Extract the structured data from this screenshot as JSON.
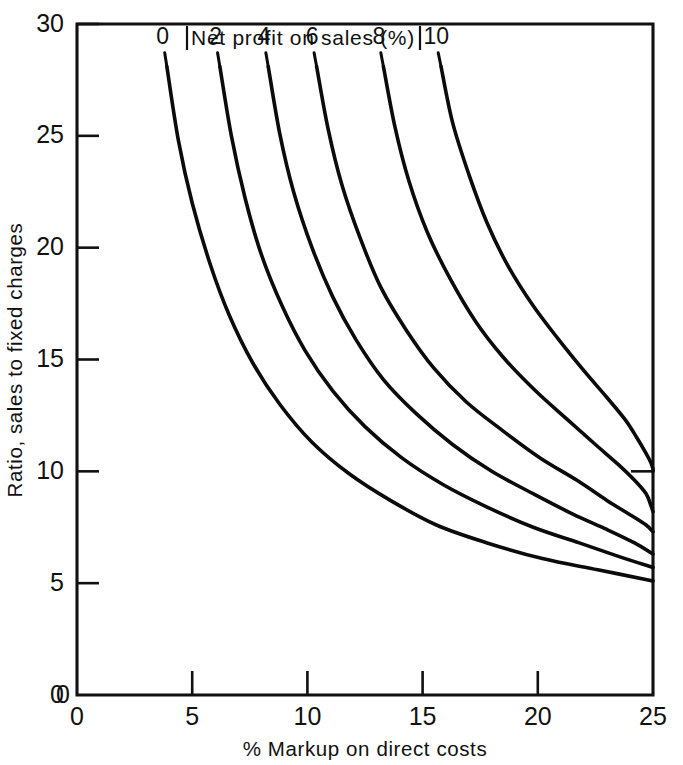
{
  "chart_data": {
    "type": "line",
    "title": "Net profit on sales (%)",
    "xlabel": "% Markup on direct costs",
    "ylabel": "Ratio, sales to fixed charges",
    "xlim": [
      0,
      25
    ],
    "ylim": [
      0,
      30
    ],
    "xticks": [
      "0",
      "5",
      "10",
      "15",
      "20",
      "25"
    ],
    "xtick_values": [
      0,
      5,
      10,
      15,
      20,
      25
    ],
    "yticks": [
      "0",
      "5",
      "10",
      "15",
      "20",
      "25",
      "30"
    ],
    "ytick_values": [
      0,
      5,
      10,
      15,
      20,
      25,
      30
    ],
    "grid": false,
    "legend_position": "top-inline-curve-labels",
    "series": [
      {
        "name": "0",
        "label": "0",
        "points": [
          {
            "x": 3.9,
            "y": 28.1
          },
          {
            "x": 4.4,
            "y": 24.8
          },
          {
            "x": 5.0,
            "y": 22.0
          },
          {
            "x": 5.8,
            "y": 19.2
          },
          {
            "x": 6.6,
            "y": 17.0
          },
          {
            "x": 7.6,
            "y": 14.9
          },
          {
            "x": 8.8,
            "y": 13.0
          },
          {
            "x": 10.2,
            "y": 11.3
          },
          {
            "x": 11.8,
            "y": 9.9
          },
          {
            "x": 13.6,
            "y": 8.7
          },
          {
            "x": 15.6,
            "y": 7.6
          },
          {
            "x": 17.8,
            "y": 6.8
          },
          {
            "x": 20.2,
            "y": 6.1
          },
          {
            "x": 22.6,
            "y": 5.6
          },
          {
            "x": 25.0,
            "y": 5.1
          }
        ]
      },
      {
        "name": "2",
        "label": "2",
        "points": [
          {
            "x": 6.2,
            "y": 28.1
          },
          {
            "x": 6.7,
            "y": 25.0
          },
          {
            "x": 7.3,
            "y": 22.2
          },
          {
            "x": 8.0,
            "y": 19.7
          },
          {
            "x": 8.9,
            "y": 17.4
          },
          {
            "x": 9.9,
            "y": 15.4
          },
          {
            "x": 11.1,
            "y": 13.6
          },
          {
            "x": 12.5,
            "y": 12.0
          },
          {
            "x": 14.1,
            "y": 10.6
          },
          {
            "x": 15.9,
            "y": 9.4
          },
          {
            "x": 17.8,
            "y": 8.4
          },
          {
            "x": 19.8,
            "y": 7.5
          },
          {
            "x": 21.8,
            "y": 6.8
          },
          {
            "x": 23.5,
            "y": 6.2
          },
          {
            "x": 25.0,
            "y": 5.7
          }
        ]
      },
      {
        "name": "4",
        "label": "4",
        "points": [
          {
            "x": 8.3,
            "y": 28.1
          },
          {
            "x": 8.8,
            "y": 25.1
          },
          {
            "x": 9.4,
            "y": 22.5
          },
          {
            "x": 10.2,
            "y": 20.0
          },
          {
            "x": 11.1,
            "y": 17.8
          },
          {
            "x": 12.1,
            "y": 15.9
          },
          {
            "x": 13.3,
            "y": 14.1
          },
          {
            "x": 14.7,
            "y": 12.6
          },
          {
            "x": 16.3,
            "y": 11.2
          },
          {
            "x": 18.0,
            "y": 10.0
          },
          {
            "x": 19.8,
            "y": 9.0
          },
          {
            "x": 21.5,
            "y": 8.1
          },
          {
            "x": 23.0,
            "y": 7.4
          },
          {
            "x": 24.2,
            "y": 6.8
          },
          {
            "x": 25.0,
            "y": 6.3
          }
        ]
      },
      {
        "name": "6",
        "label": "6",
        "points": [
          {
            "x": 10.4,
            "y": 28.1
          },
          {
            "x": 10.9,
            "y": 25.3
          },
          {
            "x": 11.5,
            "y": 22.8
          },
          {
            "x": 12.3,
            "y": 20.4
          },
          {
            "x": 13.2,
            "y": 18.2
          },
          {
            "x": 14.3,
            "y": 16.3
          },
          {
            "x": 15.5,
            "y": 14.6
          },
          {
            "x": 16.9,
            "y": 13.1
          },
          {
            "x": 18.5,
            "y": 11.8
          },
          {
            "x": 20.1,
            "y": 10.6
          },
          {
            "x": 21.7,
            "y": 9.6
          },
          {
            "x": 23.0,
            "y": 8.7
          },
          {
            "x": 24.1,
            "y": 8.0
          },
          {
            "x": 24.7,
            "y": 7.6
          },
          {
            "x": 25.0,
            "y": 7.3
          }
        ]
      },
      {
        "name": "8",
        "label": "8",
        "points": [
          {
            "x": 13.3,
            "y": 28.1
          },
          {
            "x": 13.8,
            "y": 25.4
          },
          {
            "x": 14.4,
            "y": 23.0
          },
          {
            "x": 15.2,
            "y": 20.7
          },
          {
            "x": 16.2,
            "y": 18.6
          },
          {
            "x": 17.3,
            "y": 16.7
          },
          {
            "x": 18.5,
            "y": 15.1
          },
          {
            "x": 19.9,
            "y": 13.6
          },
          {
            "x": 21.3,
            "y": 12.3
          },
          {
            "x": 22.5,
            "y": 11.2
          },
          {
            "x": 23.5,
            "y": 10.3
          },
          {
            "x": 24.2,
            "y": 9.6
          },
          {
            "x": 24.7,
            "y": 9.0
          },
          {
            "x": 24.9,
            "y": 8.5
          },
          {
            "x": 25.0,
            "y": 8.2
          }
        ]
      },
      {
        "name": "10",
        "label": "10",
        "points": [
          {
            "x": 15.8,
            "y": 28.1
          },
          {
            "x": 16.3,
            "y": 25.6
          },
          {
            "x": 17.0,
            "y": 23.3
          },
          {
            "x": 17.8,
            "y": 21.1
          },
          {
            "x": 18.7,
            "y": 19.2
          },
          {
            "x": 19.8,
            "y": 17.4
          },
          {
            "x": 20.9,
            "y": 15.9
          },
          {
            "x": 22.0,
            "y": 14.5
          },
          {
            "x": 23.0,
            "y": 13.3
          },
          {
            "x": 23.8,
            "y": 12.3
          },
          {
            "x": 24.3,
            "y": 11.5
          },
          {
            "x": 24.7,
            "y": 10.8
          },
          {
            "x": 24.9,
            "y": 10.4
          },
          {
            "x": 25.0,
            "y": 10.1
          },
          {
            "x": 25.0,
            "y": 10.0
          }
        ]
      }
    ],
    "curve_labels": [
      "0",
      "2",
      "4",
      "6",
      "8",
      "10"
    ],
    "right_edge_tick_value": 10
  },
  "axes": {
    "x_title": "% Markup on direct costs",
    "y_title": "Ratio, sales to fixed charges",
    "origin_x_label": "0",
    "origin_y_label": "0"
  },
  "legend": {
    "title": "Net profit on sales (%)"
  },
  "style": {
    "line_color": "#0b0b0b",
    "axis_color": "#111111",
    "background": "#ffffff"
  }
}
